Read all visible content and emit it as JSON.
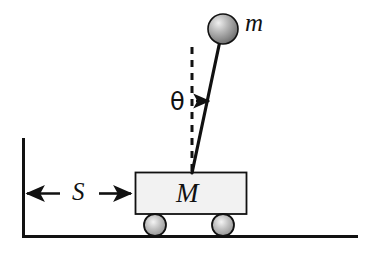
{
  "figure": {
    "kind": "physics-diagram",
    "background_color": "#ffffff",
    "line_color": "#111111",
    "labels": {
      "pendulum_bob": "m",
      "cart": "M",
      "displacement": "S",
      "angle": "θ"
    },
    "elements": {
      "ball": {
        "name": "pendulum-bob",
        "cx": 223,
        "cy": 29,
        "r": 15,
        "fill_light": "#e6e6e6",
        "fill_dark": "#6f6f6f",
        "stroke": "#111111"
      },
      "rod": {
        "name": "pendulum-rod",
        "x1": 219,
        "y1": 44,
        "x2": 192,
        "y2": 172,
        "width": 3
      },
      "dashed_vertical": {
        "name": "vertical-reference-dashed-line",
        "x": 192,
        "y1": 47,
        "y2": 172,
        "dash": "7 6",
        "width": 3
      },
      "angle_arrow": {
        "name": "angle-indicator-arrow",
        "x1": 196,
        "y1": 101,
        "x2": 211,
        "y2": 101
      },
      "cart_body": {
        "name": "cart-body",
        "x": 135,
        "y": 172,
        "width": 112,
        "height": 42,
        "fill": "#f1f1f1",
        "stroke": "#111111"
      },
      "wheel_left": {
        "name": "cart-wheel-left",
        "cx": 155,
        "cy": 225,
        "r": 11
      },
      "wheel_right": {
        "name": "cart-wheel-right",
        "cx": 223,
        "cy": 225,
        "r": 11
      },
      "ground": {
        "name": "ground-line",
        "x1": 22,
        "y1": 236,
        "x2": 358,
        "y2": 236,
        "width": 3
      },
      "wall": {
        "name": "reference-wall-line",
        "x": 22,
        "y1": 138,
        "y2": 236,
        "width": 3
      },
      "dim_arrow_left": {
        "name": "dimension-arrow-left",
        "from_x": 60,
        "to_x": 25,
        "y": 193
      },
      "dim_arrow_right": {
        "name": "dimension-arrow-right",
        "from_x": 99,
        "to_x": 133,
        "y": 193
      }
    }
  }
}
